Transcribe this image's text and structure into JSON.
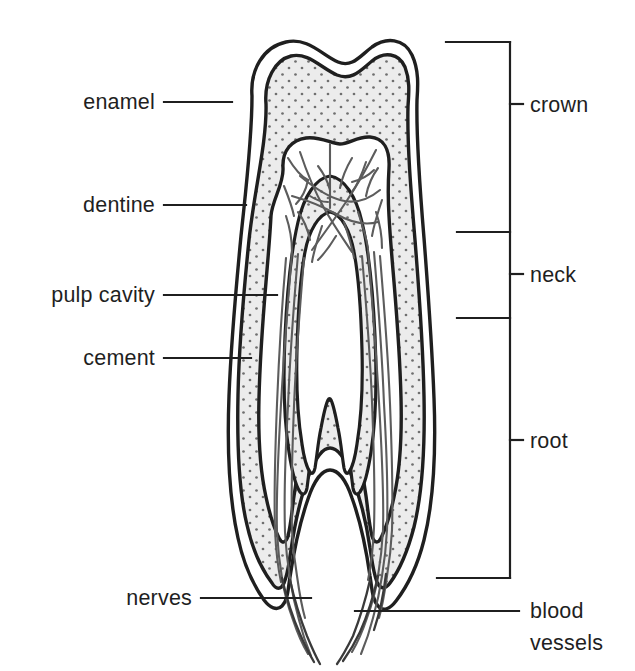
{
  "figure": {
    "background_color": "#ffffff",
    "ink_color": "#1f1f1f",
    "dentine_fill": "#ececec",
    "stipple_color": "#6f6f6f",
    "pulp_fill": "#ffffff",
    "nerve_color": "#5c5c5c"
  },
  "left_labels": [
    {
      "id": "enamel",
      "text": "enamel",
      "text_x": 155,
      "text_y": 109,
      "line_x1": 164,
      "line_x2": 232,
      "line_y": 102
    },
    {
      "id": "dentine",
      "text": "dentine",
      "text_x": 155,
      "text_y": 212,
      "line_x1": 164,
      "line_x2": 246,
      "line_y": 205
    },
    {
      "id": "pulp-cavity",
      "text": "pulp cavity",
      "text_x": 155,
      "text_y": 302,
      "line_x1": 164,
      "line_x2": 277,
      "line_y": 295
    },
    {
      "id": "cement",
      "text": "cement",
      "text_x": 155,
      "text_y": 365,
      "line_x1": 164,
      "line_x2": 251,
      "line_y": 358
    },
    {
      "id": "nerves",
      "text": "nerves",
      "text_x": 192,
      "text_y": 605,
      "line_x1": 201,
      "line_x2": 311,
      "line_y": 598
    }
  ],
  "right_labels": [
    {
      "id": "crown",
      "text": "crown",
      "text_x": 530,
      "text_y": 112,
      "tick_x1": 510,
      "tick_x2": 523,
      "tick_y": 104
    },
    {
      "id": "neck",
      "text": "neck",
      "text_x": 530,
      "text_y": 282,
      "tick_x1": 510,
      "tick_x2": 523,
      "tick_y": 274
    },
    {
      "id": "root",
      "text": "root",
      "text_x": 530,
      "text_y": 448,
      "tick_x1": 510,
      "tick_x2": 523,
      "tick_y": 440
    },
    {
      "id": "blood",
      "text": "blood",
      "text_x": 530,
      "text_y": 618,
      "tick_x1": 0,
      "tick_x2": 0,
      "tick_y": 0
    },
    {
      "id": "vessels",
      "text": "vessels",
      "text_x": 530,
      "text_y": 650,
      "tick_x1": 0,
      "tick_x2": 0,
      "tick_y": 0
    }
  ],
  "bracket": {
    "spine_x": 510,
    "top_y": 42,
    "bottom_y": 578,
    "top_arm_x": 446,
    "divider_crown_neck_y": 232,
    "divider_neck_root_y": 318,
    "divider_arm_x": 457,
    "bottom_arm_x": 437,
    "blood_vessels_leader_y": 611,
    "blood_vessels_leader_x1": 355,
    "blood_vessels_leader_x2": 519
  },
  "regions": [
    {
      "id": "enamel-cement-outer-layer",
      "name": "enamel / cement outer layer",
      "fill": "#ffffff"
    },
    {
      "id": "dentine-layer",
      "name": "dentine (stippled)",
      "fill": "#ececec"
    },
    {
      "id": "pulp-cavity-chamber",
      "name": "pulp cavity",
      "fill": "#ffffff"
    },
    {
      "id": "root-canal-left",
      "name": "left root canal",
      "fill": "#ffffff"
    },
    {
      "id": "root-canal-right",
      "name": "right root canal",
      "fill": "#ffffff"
    }
  ]
}
